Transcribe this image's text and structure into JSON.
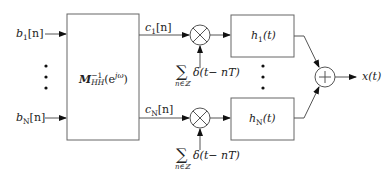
{
  "diagram": {
    "type": "signal-flow block diagram",
    "inputs": [
      {
        "symbol": "b",
        "sub": "1",
        "arg": "[n]"
      },
      {
        "symbol": "b",
        "sub": "N",
        "arg": "[n]"
      }
    ],
    "matrix_block": {
      "symbol": "M",
      "sub": "HH",
      "sup": "−1",
      "arg": "(e",
      "arg_sup": "jω",
      "arg_close": ")"
    },
    "outputs_of_matrix": [
      {
        "symbol": "c",
        "sub": "1",
        "arg": "[n]"
      },
      {
        "symbol": "c",
        "sub": "N",
        "arg": "[n]"
      }
    ],
    "impulse_train": {
      "sum_symbol": "∑",
      "sum_index": "n∈ℤ",
      "term": "δ(t− nT)"
    },
    "filters": [
      {
        "symbol": "h",
        "sub": "1",
        "arg": "(t)"
      },
      {
        "symbol": "h",
        "sub": "N",
        "arg": "(t)"
      }
    ],
    "multiplier_symbol": "×",
    "adder_symbol": "+",
    "output": {
      "label": "x(t)"
    },
    "ellipsis": "⋮",
    "colors": {
      "stroke": "#555555",
      "arrow": "#111111",
      "text": "#222222"
    }
  }
}
